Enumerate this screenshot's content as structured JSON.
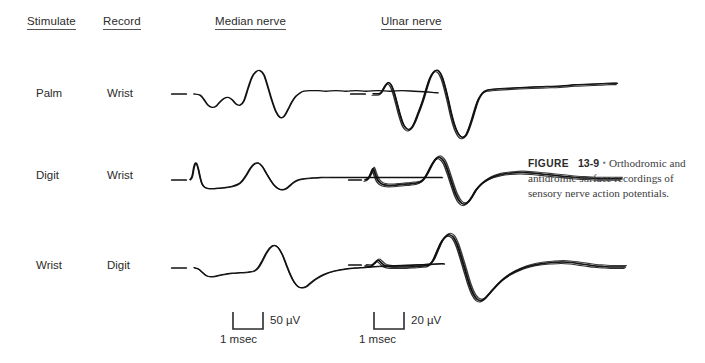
{
  "headers": {
    "stimulate": "Stimulate",
    "record": "Record",
    "median": "Median nerve",
    "ulnar": "Ulnar nerve"
  },
  "rows": [
    {
      "stimulate": "Palm",
      "record": "Wrist"
    },
    {
      "stimulate": "Digit",
      "record": "Wrist"
    },
    {
      "stimulate": "Wrist",
      "record": "Digit"
    }
  ],
  "calibration": {
    "median": {
      "amplitude": "50 µV",
      "time": "1 msec"
    },
    "ulnar": {
      "amplitude": "20 µV",
      "time": "1 msec"
    }
  },
  "caption": {
    "label": "FIGURE",
    "number": "13-9",
    "marker": "▪",
    "text": "Orthodromic and antidromic surface recordings of sensory nerve action potentials."
  },
  "chart_data": {
    "type": "line",
    "title": "Orthodromic and antidromic surface recordings of sensory nerve action potentials",
    "xlabel": "Time (msec)",
    "ylabel": "Amplitude (µV)",
    "grid": false,
    "legend": "none",
    "columns": [
      "Median nerve",
      "Ulnar nerve"
    ],
    "row_conditions": [
      {
        "stimulate": "Palm",
        "record": "Wrist"
      },
      {
        "stimulate": "Digit",
        "record": "Wrist"
      },
      {
        "stimulate": "Wrist",
        "record": "Digit"
      }
    ],
    "scale_bars": [
      {
        "column": "Median nerve",
        "amplitude": 50,
        "amplitude_unit": "µV",
        "time": 1,
        "time_unit": "msec"
      },
      {
        "column": "Ulnar nerve",
        "amplitude": 20,
        "amplitude_unit": "µV",
        "time": 1,
        "time_unit": "msec"
      }
    ],
    "traces": [
      {
        "id": "median-palm-wrist",
        "column": "Median nerve",
        "stimulate": "Palm",
        "record": "Wrist",
        "stim_artifact": {
          "x": 6,
          "y": 50,
          "width": 14
        },
        "superimposed_sweeps": 1,
        "points": [
          [
            28,
            50
          ],
          [
            34,
            52
          ],
          [
            38,
            60
          ],
          [
            42,
            70
          ],
          [
            46,
            74
          ],
          [
            50,
            72
          ],
          [
            54,
            64
          ],
          [
            58,
            58
          ],
          [
            62,
            56
          ],
          [
            66,
            60
          ],
          [
            70,
            68
          ],
          [
            74,
            70
          ],
          [
            78,
            62
          ],
          [
            82,
            40
          ],
          [
            86,
            20
          ],
          [
            90,
            10
          ],
          [
            94,
            8
          ],
          [
            98,
            16
          ],
          [
            102,
            38
          ],
          [
            106,
            62
          ],
          [
            110,
            82
          ],
          [
            114,
            92
          ],
          [
            118,
            90
          ],
          [
            122,
            78
          ],
          [
            126,
            64
          ],
          [
            130,
            54
          ],
          [
            134,
            48
          ],
          [
            138,
            45
          ],
          [
            144,
            44
          ],
          [
            152,
            44
          ],
          [
            160,
            45
          ],
          [
            170,
            44
          ],
          [
            180,
            45
          ],
          [
            190,
            44
          ],
          [
            200,
            45
          ],
          [
            212,
            44
          ],
          [
            224,
            45
          ],
          [
            236,
            44
          ],
          [
            248,
            45
          ],
          [
            258,
            46
          ],
          [
            266,
            47
          ],
          [
            272,
            48
          ]
        ]
      },
      {
        "id": "ulnar-palm-wrist",
        "column": "Ulnar nerve",
        "stimulate": "Palm",
        "record": "Wrist",
        "stim_artifact": {
          "x": 6,
          "y": 50,
          "width": 14
        },
        "superimposed_sweeps": 3,
        "points": [
          [
            28,
            50
          ],
          [
            32,
            50
          ],
          [
            36,
            48
          ],
          [
            40,
            36
          ],
          [
            43,
            30
          ],
          [
            46,
            34
          ],
          [
            49,
            48
          ],
          [
            52,
            68
          ],
          [
            55,
            88
          ],
          [
            58,
            104
          ],
          [
            61,
            112
          ],
          [
            64,
            114
          ],
          [
            67,
            110
          ],
          [
            70,
            100
          ],
          [
            73,
            86
          ],
          [
            76,
            72
          ],
          [
            79,
            56
          ],
          [
            82,
            38
          ],
          [
            85,
            22
          ],
          [
            88,
            12
          ],
          [
            91,
            8
          ],
          [
            94,
            10
          ],
          [
            97,
            20
          ],
          [
            100,
            38
          ],
          [
            103,
            60
          ],
          [
            106,
            84
          ],
          [
            109,
            104
          ],
          [
            112,
            118
          ],
          [
            115,
            126
          ],
          [
            118,
            128
          ],
          [
            121,
            124
          ],
          [
            124,
            112
          ],
          [
            127,
            96
          ],
          [
            130,
            78
          ],
          [
            133,
            62
          ],
          [
            136,
            52
          ],
          [
            139,
            46
          ],
          [
            143,
            43
          ],
          [
            148,
            42
          ],
          [
            155,
            41
          ],
          [
            164,
            40
          ],
          [
            175,
            39
          ],
          [
            188,
            38
          ],
          [
            202,
            37
          ],
          [
            216,
            36
          ],
          [
            230,
            34
          ],
          [
            244,
            33
          ],
          [
            256,
            32
          ],
          [
            266,
            31
          ],
          [
            272,
            31
          ]
        ]
      },
      {
        "id": "median-digit-wrist",
        "column": "Median nerve",
        "stimulate": "Digit",
        "record": "Wrist",
        "stim_artifact": {
          "x": 6,
          "y": 50,
          "width": 14
        },
        "superimposed_sweeps": 2,
        "points": [
          [
            24,
            50
          ],
          [
            26,
            44
          ],
          [
            28,
            26
          ],
          [
            30,
            20
          ],
          [
            32,
            30
          ],
          [
            34,
            46
          ],
          [
            36,
            58
          ],
          [
            39,
            64
          ],
          [
            43,
            66
          ],
          [
            48,
            66
          ],
          [
            54,
            65
          ],
          [
            60,
            64
          ],
          [
            66,
            62
          ],
          [
            72,
            58
          ],
          [
            76,
            52
          ],
          [
            80,
            42
          ],
          [
            84,
            30
          ],
          [
            88,
            22
          ],
          [
            92,
            20
          ],
          [
            96,
            26
          ],
          [
            100,
            38
          ],
          [
            104,
            50
          ],
          [
            108,
            60
          ],
          [
            112,
            66
          ],
          [
            116,
            68
          ],
          [
            120,
            66
          ],
          [
            124,
            60
          ],
          [
            128,
            54
          ],
          [
            133,
            50
          ],
          [
            139,
            48
          ],
          [
            146,
            47
          ],
          [
            155,
            46
          ],
          [
            166,
            46
          ],
          [
            178,
            46
          ],
          [
            192,
            46
          ],
          [
            206,
            46
          ],
          [
            220,
            46
          ],
          [
            234,
            46
          ],
          [
            248,
            46
          ],
          [
            260,
            46
          ],
          [
            270,
            46
          ],
          [
            276,
            46
          ]
        ]
      },
      {
        "id": "ulnar-digit-wrist",
        "column": "Ulnar nerve",
        "stimulate": "Digit",
        "record": "Wrist",
        "stim_artifact": {
          "x": 4,
          "y": 50,
          "width": 12
        },
        "superimposed_sweeps": 4,
        "points": [
          [
            20,
            50
          ],
          [
            23,
            48
          ],
          [
            26,
            38
          ],
          [
            28,
            30
          ],
          [
            30,
            40
          ],
          [
            33,
            52
          ],
          [
            37,
            58
          ],
          [
            42,
            60
          ],
          [
            48,
            60
          ],
          [
            54,
            59
          ],
          [
            60,
            58
          ],
          [
            66,
            57
          ],
          [
            71,
            56
          ],
          [
            75,
            54
          ],
          [
            79,
            48
          ],
          [
            83,
            36
          ],
          [
            87,
            22
          ],
          [
            91,
            12
          ],
          [
            95,
            10
          ],
          [
            99,
            18
          ],
          [
            103,
            36
          ],
          [
            107,
            58
          ],
          [
            111,
            78
          ],
          [
            115,
            90
          ],
          [
            119,
            94
          ],
          [
            123,
            90
          ],
          [
            127,
            80
          ],
          [
            131,
            68
          ],
          [
            136,
            58
          ],
          [
            142,
            50
          ],
          [
            149,
            44
          ],
          [
            157,
            40
          ],
          [
            166,
            38
          ],
          [
            176,
            37
          ],
          [
            187,
            38
          ],
          [
            198,
            40
          ],
          [
            209,
            42
          ],
          [
            220,
            44
          ],
          [
            231,
            46
          ],
          [
            242,
            47
          ],
          [
            252,
            48
          ],
          [
            262,
            48
          ],
          [
            270,
            48
          ],
          [
            276,
            48
          ]
        ]
      },
      {
        "id": "median-wrist-digit",
        "column": "Median nerve",
        "stimulate": "Wrist",
        "record": "Digit",
        "stim_artifact": {
          "x": 6,
          "y": 50,
          "width": 14
        },
        "superimposed_sweeps": 2,
        "points": [
          [
            28,
            50
          ],
          [
            32,
            52
          ],
          [
            36,
            58
          ],
          [
            40,
            64
          ],
          [
            44,
            66
          ],
          [
            50,
            65
          ],
          [
            58,
            62
          ],
          [
            66,
            60
          ],
          [
            74,
            59
          ],
          [
            82,
            58
          ],
          [
            88,
            56
          ],
          [
            92,
            50
          ],
          [
            96,
            38
          ],
          [
            100,
            24
          ],
          [
            104,
            14
          ],
          [
            108,
            10
          ],
          [
            112,
            14
          ],
          [
            116,
            26
          ],
          [
            120,
            44
          ],
          [
            124,
            62
          ],
          [
            128,
            76
          ],
          [
            132,
            84
          ],
          [
            136,
            86
          ],
          [
            140,
            84
          ],
          [
            144,
            78
          ],
          [
            150,
            70
          ],
          [
            158,
            62
          ],
          [
            168,
            56
          ],
          [
            180,
            52
          ],
          [
            194,
            50
          ],
          [
            208,
            48
          ],
          [
            222,
            47
          ],
          [
            236,
            46
          ],
          [
            250,
            45
          ],
          [
            262,
            44
          ],
          [
            272,
            43
          ],
          [
            278,
            43
          ]
        ]
      },
      {
        "id": "ulnar-wrist-digit",
        "column": "Ulnar nerve",
        "stimulate": "Wrist",
        "record": "Digit",
        "stim_artifact": {
          "x": 4,
          "y": 50,
          "width": 12
        },
        "superimposed_sweeps": 4,
        "points": [
          [
            20,
            52
          ],
          [
            26,
            52
          ],
          [
            30,
            46
          ],
          [
            33,
            42
          ],
          [
            36,
            46
          ],
          [
            40,
            52
          ],
          [
            46,
            54
          ],
          [
            54,
            54
          ],
          [
            62,
            54
          ],
          [
            70,
            53
          ],
          [
            78,
            52
          ],
          [
            84,
            50
          ],
          [
            88,
            42
          ],
          [
            92,
            26
          ],
          [
            96,
            10
          ],
          [
            100,
            0
          ],
          [
            104,
            -4
          ],
          [
            108,
            0
          ],
          [
            112,
            14
          ],
          [
            116,
            36
          ],
          [
            120,
            60
          ],
          [
            124,
            84
          ],
          [
            128,
            102
          ],
          [
            132,
            112
          ],
          [
            136,
            114
          ],
          [
            140,
            110
          ],
          [
            145,
            100
          ],
          [
            151,
            88
          ],
          [
            158,
            76
          ],
          [
            166,
            66
          ],
          [
            175,
            58
          ],
          [
            185,
            52
          ],
          [
            196,
            48
          ],
          [
            207,
            46
          ],
          [
            217,
            45
          ],
          [
            226,
            46
          ],
          [
            234,
            48
          ],
          [
            242,
            50
          ],
          [
            250,
            52
          ],
          [
            258,
            53
          ],
          [
            266,
            54
          ],
          [
            274,
            54
          ],
          [
            280,
            54
          ]
        ]
      }
    ]
  }
}
